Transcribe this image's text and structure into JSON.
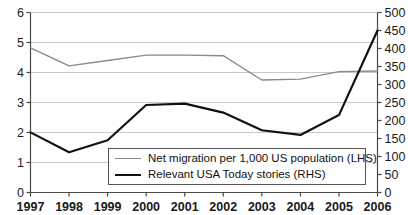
{
  "chart_data": {
    "type": "line",
    "title": "",
    "xlabel": "",
    "ylabel": "",
    "categories": [
      "1997",
      "1998",
      "1999",
      "2000",
      "2001",
      "2002",
      "2003",
      "2004",
      "2005",
      "2006"
    ],
    "grid": true,
    "legend_position": "bottom-center",
    "axes": {
      "left": {
        "label": "Net migration per 1,000 US population",
        "min": 0,
        "max": 6,
        "step": 1,
        "ticks": [
          "0",
          "1",
          "2",
          "3",
          "4",
          "5",
          "6"
        ]
      },
      "right": {
        "label": "Relevant USA Today stories",
        "min": 0,
        "max": 500,
        "step": 50,
        "ticks": [
          "0",
          "50",
          "100",
          "150",
          "200",
          "250",
          "300",
          "350",
          "400",
          "450",
          "500"
        ]
      }
    },
    "series": [
      {
        "name": "Net migration per 1,000 US population (LHS)",
        "axis": "left",
        "color": "#8a8a8a",
        "width": 1.4,
        "values": [
          4.82,
          4.22,
          4.4,
          4.58,
          4.58,
          4.56,
          3.75,
          3.78,
          4.03,
          4.05
        ]
      },
      {
        "name": "Relevant USA Today stories (RHS)",
        "axis": "right",
        "color": "#111111",
        "width": 2.2,
        "values": [
          167,
          112,
          145,
          243,
          247,
          222,
          173,
          160,
          215,
          450
        ]
      }
    ]
  },
  "legend": {
    "items": [
      {
        "label": "Net migration per 1,000 US population (LHS)",
        "style": "gray"
      },
      {
        "label": "Relevant USA Today stories (RHS)",
        "style": "black"
      }
    ]
  }
}
